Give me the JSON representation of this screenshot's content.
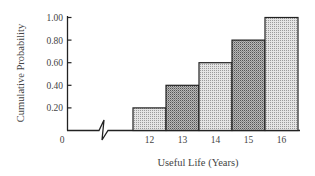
{
  "chart_data": {
    "type": "bar",
    "title": "",
    "xlabel": "Useful Life (Years)",
    "ylabel": "Cumulative Probability",
    "categories": [
      "12",
      "13",
      "14",
      "15",
      "16"
    ],
    "values": [
      0.2,
      0.4,
      0.6,
      0.8,
      1.0
    ],
    "ylim": [
      0,
      1.0
    ],
    "yticks": [
      "1.00",
      "0.80",
      "0.60",
      "0.40",
      "0.20"
    ],
    "x_origin_label": "0",
    "axis_break": true,
    "grid": false,
    "legend": null,
    "bar_fills": [
      "light",
      "dark",
      "light",
      "dark",
      "light"
    ]
  },
  "colors": {
    "light_fill": "#d6d6d6",
    "dark_fill": "#a8a8a8",
    "stroke": "#222222"
  }
}
